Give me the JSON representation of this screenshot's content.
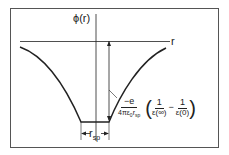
{
  "diagram": {
    "y_axis_label": "ϕ(r)",
    "x_axis_label": "r",
    "width_label": "r",
    "width_label_sub": "sp",
    "formula": {
      "prefactor_num": "−e",
      "prefactor_den": "4πε",
      "prefactor_den_sub": "0",
      "prefactor_den_r": "r",
      "prefactor_den_r_sub": "sp",
      "term1_num": "1",
      "term1_den": "ε(∞)",
      "minus": "−",
      "term2_num": "1",
      "term2_den": "ε(0)"
    },
    "colors": {
      "line": "#222222",
      "frame": "#444444",
      "background": "#ffffff"
    }
  }
}
